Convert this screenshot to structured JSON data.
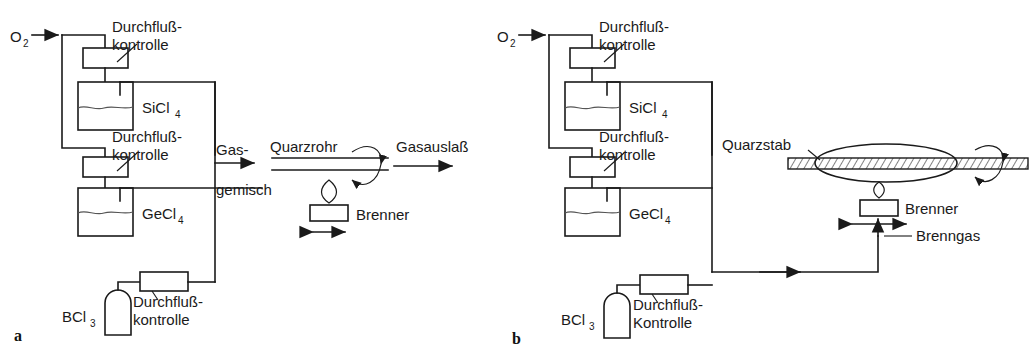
{
  "figure": {
    "width": 1032,
    "height": 355,
    "background": "#ffffff",
    "line_color": "#1a1a1a"
  },
  "panel_a": {
    "letter": "a",
    "inlet_label": "O",
    "inlet_sub": "2",
    "flow_controller_1": "Durchfluß-",
    "flow_controller_1b": "kontrolle",
    "bubbler_1": "SiCl",
    "bubbler_1_sub": "4",
    "flow_controller_2": "Durchfluß-",
    "flow_controller_2b": "kontrolle",
    "bubbler_2": "GeCl",
    "bubbler_2_sub": "4",
    "cylinder_label": "BCl",
    "cylinder_sub": "3",
    "flow_controller_3": "Durchfluß-",
    "flow_controller_3b": "kontrolle",
    "gas_mix_1": "Gas-",
    "gas_mix_2": "gemisch",
    "tube_label": "Quarzrohr",
    "outlet_label": "Gasauslaß",
    "burner_label": "Brenner"
  },
  "panel_b": {
    "letter": "b",
    "inlet_label": "O",
    "inlet_sub": "2",
    "flow_controller_1": "Durchfluß-",
    "flow_controller_1b": "kontrolle",
    "bubbler_1": "SiCl",
    "bubbler_1_sub": "4",
    "flow_controller_2": "Durchfluß-",
    "flow_controller_2b": "kontrolle",
    "bubbler_2": "GeCl",
    "bubbler_2_sub": "4",
    "cylinder_label": "BCl",
    "cylinder_sub": "3",
    "flow_controller_3": "Durchfluß-",
    "flow_controller_3b": "Kontrolle",
    "rod_label": "Quarzstab",
    "burner_label": "Brenner",
    "burner_gas_label": "Brenngas"
  }
}
